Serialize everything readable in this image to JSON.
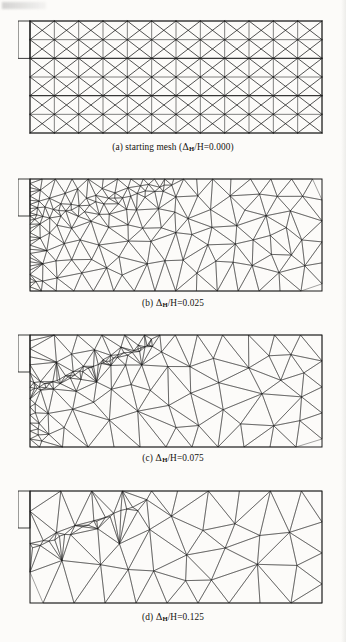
{
  "figure": {
    "type": "finite-element-mesh-series",
    "symbol": "Δ",
    "subscript": "H",
    "denominator": "H"
  },
  "panels": [
    {
      "id": "a",
      "label": "(a)",
      "caption_text": "(a) starting mesh (",
      "caption_tail": "/H=0.000)",
      "name": "starting mesh",
      "ratio_value": "0.000",
      "mesh_type": "structured",
      "grid_cols": 12,
      "grid_rows": 6,
      "cell_pattern": "crossed-diagonals",
      "refinement": "uniform",
      "notch": {
        "rows_spanned": 2,
        "side": "left"
      }
    },
    {
      "id": "b",
      "label": "(b)",
      "caption_text": "(b) ",
      "caption_tail": "/H=0.025",
      "ratio_value": "0.025",
      "mesh_type": "unstructured-triangular",
      "refinement": "graded, dense near notch tip and lower-left",
      "notch": {
        "rows_spanned": 2,
        "side": "left"
      }
    },
    {
      "id": "c",
      "label": "(c)",
      "caption_text": "(c) ",
      "caption_tail": "/H=0.075",
      "ratio_value": "0.075",
      "mesh_type": "unstructured-triangular",
      "refinement": "concentrated along emerging diagonal shear band",
      "notch": {
        "rows_spanned": 2,
        "side": "left"
      }
    },
    {
      "id": "d",
      "label": "(d)",
      "caption_text": "(d) ",
      "caption_tail": "/H=0.125",
      "ratio_value": "0.125",
      "mesh_type": "unstructured-triangular",
      "refinement": "narrow intensely refined diagonal shear band from notch tip",
      "notch": {
        "rows_spanned": 2,
        "side": "left"
      }
    }
  ],
  "colors": {
    "ink": "#14120f",
    "paper": "#fcfbf9",
    "mesh_line": "#1a1a1a"
  }
}
